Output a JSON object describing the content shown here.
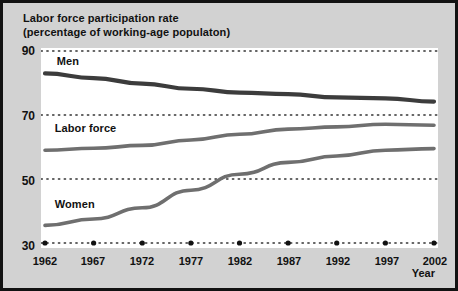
{
  "chart_data": {
    "type": "line",
    "title": "Labor force participation rate",
    "subtitle": "(percentage of working-age populaton)",
    "xlabel": "Year",
    "ylabel": "",
    "xlim": [
      1962,
      2002
    ],
    "ylim": [
      30,
      90
    ],
    "yticks": [
      30,
      50,
      70,
      90
    ],
    "xticks": [
      1962,
      1967,
      1972,
      1977,
      1982,
      1987,
      1992,
      1997,
      2002
    ],
    "grid": "horizontal-dotted",
    "legend": "inline-labels",
    "x": [
      1962,
      1967,
      1972,
      1977,
      1982,
      1987,
      1992,
      1997,
      2002
    ],
    "series": [
      {
        "name": "Men",
        "color": "#3c3c3c",
        "label_x": 1963.2,
        "label_y": 86.5,
        "values": [
          83.0,
          81.5,
          79.8,
          78.2,
          77.0,
          76.5,
          75.5,
          75.2,
          74.2
        ]
      },
      {
        "name": "Labor force",
        "color": "#6f6f6f",
        "label_x": 1963.0,
        "label_y": 65.5,
        "values": [
          59.0,
          59.6,
          60.5,
          62.2,
          64.0,
          65.6,
          66.3,
          67.1,
          66.8
        ]
      },
      {
        "name": "Women",
        "color": "#6f6f6f",
        "label_x": 1963.0,
        "label_y": 42.0,
        "values": [
          35.5,
          37.5,
          41.0,
          46.5,
          51.5,
          55.2,
          57.2,
          59.0,
          59.5
        ]
      }
    ],
    "colors": {
      "men_line": "#3c3c3c",
      "labor_force_line": "#6f6f6f",
      "women_line": "#6f6f6f",
      "plot_background": "#ffffff",
      "figure_background": "#d2d2d2",
      "frame": "#121212",
      "text": "#111111",
      "gridline": "#333333"
    }
  },
  "axis": {
    "y_tick_labels": [
      "90",
      "70",
      "50",
      "30"
    ],
    "x_tick_labels": [
      "1962",
      "1967",
      "1972",
      "1977",
      "1982",
      "1987",
      "1992",
      "1997",
      "2002"
    ],
    "x_axis_name": "Year"
  },
  "header": {
    "title": "Labor force participation rate",
    "subtitle": "(percentage of working-age populaton)"
  },
  "series_labels": {
    "men": "Men",
    "labor_force": "Labor force",
    "women": "Women"
  }
}
